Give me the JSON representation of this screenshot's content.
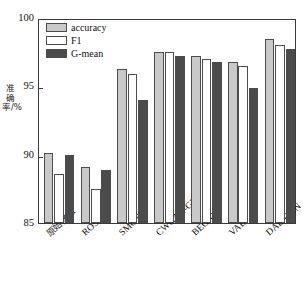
{
  "chart_data": {
    "type": "bar",
    "title": "",
    "xlabel": "",
    "ylabel": "准确率/%",
    "ylim": [
      85,
      100
    ],
    "yticks": [
      85,
      90,
      95,
      100
    ],
    "grid": false,
    "legend_position": "top-left",
    "categories": [
      "原始样本",
      "ROS",
      "SMOTE",
      "CWGAN-GP",
      "BEGAN",
      "VAE",
      "DAE-GAN"
    ],
    "series": [
      {
        "name": "accuracy",
        "color": "#c9c9c9",
        "values": [
          90.1,
          89.1,
          96.3,
          97.5,
          97.2,
          96.8,
          98.5
        ]
      },
      {
        "name": "F1",
        "color": "#ffffff",
        "values": [
          88.6,
          87.5,
          95.9,
          97.5,
          97.0,
          96.5,
          98.0
        ]
      },
      {
        "name": "G-mean",
        "color": "#4b4b4b",
        "values": [
          90.0,
          88.9,
          94.0,
          97.2,
          96.8,
          94.9,
          97.7
        ]
      }
    ]
  },
  "axes": {
    "y_tick_labels": [
      "100",
      "95",
      "90",
      "85"
    ],
    "y_axis_title": "准确率/%"
  },
  "legend": {
    "items": [
      {
        "label": "accuracy",
        "color": "#c9c9c9"
      },
      {
        "label": "F1",
        "color": "#ffffff"
      },
      {
        "label": "G-mean",
        "color": "#4b4b4b"
      }
    ]
  },
  "style": {
    "frame_color": "#3a3a3a",
    "bar_edge_color": "#4c4c4c",
    "background": "#ffffff"
  }
}
